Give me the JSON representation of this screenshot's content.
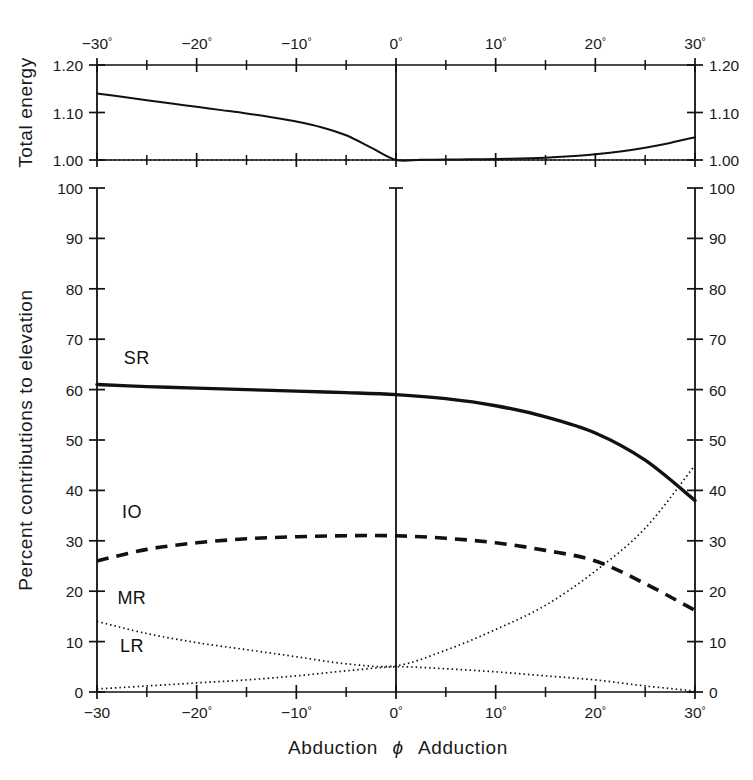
{
  "figure": {
    "bottom_axis_title_left": "Abduction",
    "bottom_axis_title_symbol": "ϕ",
    "bottom_axis_title_right": "Adduction",
    "top_panel_ylabel": "Total energy",
    "main_panel_ylabel": "Percent contributions to elevation"
  },
  "axes": {
    "x_tick_labels_top": [
      "−30°",
      "−20°",
      "−10°",
      "0°",
      "10°",
      "20°",
      "30°"
    ],
    "x_tick_labels_bottom": [
      "−30",
      "−20°",
      "−10°",
      "0°",
      "10°",
      "20°",
      "30°"
    ],
    "x_major_values": [
      -30,
      -20,
      -10,
      0,
      10,
      20,
      30
    ],
    "x_minor_values": [
      -25,
      -15,
      -5,
      5,
      15,
      25
    ],
    "x_range": [
      -30,
      30
    ],
    "energy_y_tick_labels": [
      "1.00",
      "1.10",
      "1.20"
    ],
    "energy_y_values": [
      1.0,
      1.1,
      1.2
    ],
    "energy_y_range": [
      1.0,
      1.2
    ],
    "percent_y_tick_labels": [
      "0",
      "10",
      "20",
      "30",
      "40",
      "50",
      "60",
      "70",
      "80",
      "90",
      "100"
    ],
    "percent_y_values": [
      0,
      10,
      20,
      30,
      40,
      50,
      60,
      70,
      80,
      90,
      100
    ],
    "percent_y_range": [
      0,
      100
    ]
  },
  "colors": {
    "ink": "#111111",
    "background": "#ffffff"
  },
  "chart_data": [
    {
      "type": "line",
      "panel": "top",
      "title": "",
      "xlabel": "Abduction ϕ Adduction",
      "ylabel": "Total energy",
      "xlim": [
        -30,
        30
      ],
      "ylim": [
        1.0,
        1.2
      ],
      "grid": false,
      "legend": "none",
      "series": [
        {
          "name": "Total energy",
          "style": "solid",
          "x": [
            -30,
            -27.5,
            -25,
            -22.5,
            -20,
            -17.5,
            -15,
            -12.5,
            -10,
            -7.5,
            -5,
            -2.5,
            0,
            2.5,
            5,
            7.5,
            10,
            12.5,
            15,
            17.5,
            20,
            22.5,
            25,
            27.5,
            30
          ],
          "values": [
            1.14,
            1.133,
            1.126,
            1.119,
            1.112,
            1.105,
            1.098,
            1.09,
            1.081,
            1.069,
            1.052,
            1.026,
            1.0,
            1.0005,
            1.001,
            1.0015,
            1.002,
            1.003,
            1.005,
            1.008,
            1.012,
            1.018,
            1.026,
            1.036,
            1.048
          ]
        },
        {
          "name": "Baseline (1.00)",
          "style": "dotted",
          "x": [
            -30,
            30
          ],
          "values": [
            1.0,
            1.0
          ]
        }
      ]
    },
    {
      "type": "line",
      "panel": "main",
      "title": "",
      "xlabel": "Abduction ϕ Adduction",
      "ylabel": "Percent contributions to elevation",
      "xlim": [
        -30,
        30
      ],
      "ylim": [
        0,
        100
      ],
      "grid": false,
      "legend": "inline-labels",
      "x": [
        -30,
        -25,
        -20,
        -15,
        -10,
        -5,
        0,
        5,
        10,
        15,
        20,
        25,
        30
      ],
      "series": [
        {
          "name": "SR",
          "label": "SR",
          "style": "solid-thick",
          "values": [
            61.0,
            60.6,
            60.3,
            60.0,
            59.7,
            59.4,
            59.0,
            58.2,
            56.8,
            54.6,
            51.4,
            46.0,
            38.0
          ],
          "label_x": -26.0,
          "label_y": 65.0
        },
        {
          "name": "IO",
          "label": "IO",
          "style": "dashed-thick",
          "values": [
            26.0,
            28.3,
            29.6,
            30.4,
            30.8,
            31.0,
            31.0,
            30.5,
            29.6,
            28.1,
            26.0,
            21.5,
            16.2
          ],
          "label_x": -26.5,
          "label_y": 34.5
        },
        {
          "name": "MR",
          "label": "MR",
          "style": "dotted",
          "values": [
            14.0,
            11.6,
            9.8,
            8.4,
            7.0,
            5.6,
            5.2,
            8.3,
            12.4,
            17.2,
            24.0,
            32.5,
            45.0
          ],
          "label_x": -26.5,
          "label_y": 17.5
        },
        {
          "name": "LR",
          "label": "LR",
          "style": "dotted",
          "values": [
            0.6,
            1.2,
            1.8,
            2.4,
            3.2,
            4.2,
            5.0,
            4.6,
            4.0,
            3.2,
            2.4,
            1.2,
            0.2
          ],
          "label_x": -26.5,
          "label_y": 8.0
        }
      ]
    }
  ]
}
